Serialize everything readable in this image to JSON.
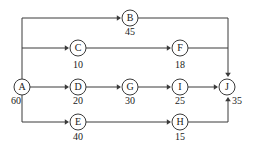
{
  "diagram": {
    "type": "activity-network-diagram",
    "title": "",
    "colors": {
      "line": "#3a3a3a",
      "node_fill": "#ffffff",
      "text": "#1a1a1a",
      "background": "#ffffff"
    },
    "nodes": [
      {
        "id": "A",
        "label": "A",
        "duration": "60",
        "cx": 22,
        "cy": 87,
        "r": 8,
        "duration_x": 16,
        "duration_y": 104,
        "duration_anchor": "end"
      },
      {
        "id": "B",
        "label": "B",
        "duration": "45",
        "cx": 130,
        "cy": 18,
        "r": 8,
        "duration_x": 130,
        "duration_y": 35,
        "duration_anchor": "middle"
      },
      {
        "id": "C",
        "label": "C",
        "duration": "10",
        "cx": 78,
        "cy": 48,
        "r": 8,
        "duration_x": 78,
        "duration_y": 68,
        "duration_anchor": "middle"
      },
      {
        "id": "D",
        "label": "D",
        "duration": "20",
        "cx": 78,
        "cy": 87,
        "r": 8,
        "duration_x": 78,
        "duration_y": 104,
        "duration_anchor": "middle"
      },
      {
        "id": "E",
        "label": "E",
        "duration": "40",
        "cx": 78,
        "cy": 122,
        "r": 8,
        "duration_x": 78,
        "duration_y": 140,
        "duration_anchor": "middle"
      },
      {
        "id": "F",
        "label": "F",
        "duration": "18",
        "cx": 180,
        "cy": 48,
        "r": 8,
        "duration_x": 180,
        "duration_y": 68,
        "duration_anchor": "middle"
      },
      {
        "id": "G",
        "label": "G",
        "duration": "30",
        "cx": 130,
        "cy": 87,
        "r": 8,
        "duration_x": 130,
        "duration_y": 104,
        "duration_anchor": "middle"
      },
      {
        "id": "H",
        "label": "H",
        "duration": "15",
        "cx": 180,
        "cy": 122,
        "r": 8,
        "duration_x": 180,
        "duration_y": 140,
        "duration_anchor": "middle"
      },
      {
        "id": "I",
        "label": "I",
        "duration": "25",
        "cx": 180,
        "cy": 87,
        "r": 8,
        "duration_x": 180,
        "duration_y": 104,
        "duration_anchor": "middle"
      },
      {
        "id": "J",
        "label": "J",
        "duration": "35",
        "cx": 227,
        "cy": 87,
        "r": 8,
        "duration_x": 237,
        "duration_y": 104,
        "duration_anchor": "start"
      }
    ],
    "edges": [
      {
        "from": "A",
        "to": "B",
        "path": "M 22,79 L 22,18 L 119,18",
        "arrow": {
          "x": 121,
          "y": 18,
          "dir": "right"
        }
      },
      {
        "from": "A",
        "to": "C",
        "path": "M 22,48 L 67,48",
        "arrow": {
          "x": 69,
          "y": 48,
          "dir": "right"
        }
      },
      {
        "from": "A",
        "to": "D",
        "path": "M 30,87 L 67,87",
        "arrow": {
          "x": 69,
          "y": 87,
          "dir": "right"
        }
      },
      {
        "from": "A",
        "to": "E",
        "path": "M 22,95 L 22,122 L 67,122",
        "arrow": {
          "x": 69,
          "y": 122,
          "dir": "right"
        }
      },
      {
        "from": "B",
        "to": "J",
        "path": "M 138,18 L 228,18 L 228,74",
        "arrow": {
          "x": 228,
          "y": 77,
          "dir": "down"
        }
      },
      {
        "from": "C",
        "to": "F",
        "path": "M 86,48 L 169,48",
        "arrow": {
          "x": 171,
          "y": 48,
          "dir": "right"
        }
      },
      {
        "from": "D",
        "to": "G",
        "path": "M 86,87 L 119,87",
        "arrow": {
          "x": 121,
          "y": 87,
          "dir": "right"
        }
      },
      {
        "from": "E",
        "to": "H",
        "path": "M 86,122 L 169,122",
        "arrow": {
          "x": 171,
          "y": 122,
          "dir": "right"
        }
      },
      {
        "from": "F",
        "to": "J",
        "path": "M 188,48 L 228,48",
        "arrow": null
      },
      {
        "from": "G",
        "to": "I",
        "path": "M 138,87 L 169,87",
        "arrow": {
          "x": 171,
          "y": 87,
          "dir": "right"
        }
      },
      {
        "from": "H",
        "to": "J",
        "path": "M 188,122 L 228,122 L 228,100",
        "arrow": {
          "x": 228,
          "y": 97,
          "dir": "up"
        }
      },
      {
        "from": "I",
        "to": "J",
        "path": "M 188,87 L 216,87",
        "arrow": {
          "x": 218,
          "y": 87,
          "dir": "right"
        }
      }
    ]
  }
}
